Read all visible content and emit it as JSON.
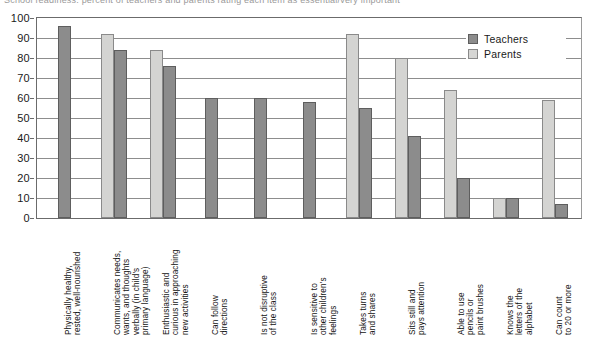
{
  "top_cropped_text": "School readiness: percent of teachers and parents rating each item as essential/very important",
  "legend": {
    "position": "top-right",
    "items": [
      {
        "label": "Teachers",
        "color": "#8c8c8c",
        "key": "teachers"
      },
      {
        "label": "Parents",
        "color": "#d4d4d2",
        "key": "parents"
      }
    ]
  },
  "yaxis": {
    "ticks": [
      "0",
      "10",
      "20",
      "30",
      "40",
      "50",
      "60",
      "70",
      "80",
      "90",
      "100"
    ],
    "min": 0,
    "max": 100
  },
  "chart_data": {
    "type": "bar",
    "title": "",
    "subtitle": "",
    "xlabel": "",
    "ylabel": "",
    "ylim": [
      0,
      100
    ],
    "grid": true,
    "legend_position": "top-right",
    "categories": [
      "Physically healthy, rested, well-nourished",
      "Communicates needs, wants, and thoughts verbally (in child's primary language)",
      "Enthusiastic and curious in approaching new activities",
      "Can follow directions",
      "Is not disruptive of the class",
      "Is sensitive to other children's feelings",
      "Takes turns and shares",
      "Sits still and pays attention",
      "Able to use pencils or paint brushes",
      "Knows the letters of the alphabet",
      "Can count to 20 or more"
    ],
    "category_lines": [
      [
        "Physically healthy,",
        "rested, well-nourished"
      ],
      [
        "Communicates needs,",
        "wants, and thoughts",
        "verbally (in child's",
        "primary language)"
      ],
      [
        "Enthusiastic and",
        "curious in approaching",
        "new activities"
      ],
      [
        "Can follow",
        "directions"
      ],
      [
        "Is not disruptive",
        "of the class"
      ],
      [
        "Is sensitive to",
        "other children's",
        "feelings"
      ],
      [
        "Takes turns",
        "and shares"
      ],
      [
        "Sits still and",
        "pays attention"
      ],
      [
        "Able to use",
        "pencils or",
        "paint brushes"
      ],
      [
        "Knows the",
        "letters of the",
        "alphabet"
      ],
      [
        "Can count",
        "to 20 or more"
      ]
    ],
    "series": [
      {
        "name": "Teachers",
        "color": "#8c8c8c",
        "values": [
          96,
          84,
          76,
          60,
          60,
          58,
          55,
          41,
          20,
          10,
          7
        ]
      },
      {
        "name": "Parents",
        "color": "#d4d4d2",
        "values": [
          null,
          92,
          84,
          null,
          null,
          null,
          92,
          80,
          64,
          10,
          59
        ]
      }
    ],
    "bar_order_per_group": [
      [
        "teachers"
      ],
      [
        "parents",
        "teachers"
      ],
      [
        "parents",
        "teachers"
      ],
      [
        "teachers"
      ],
      [
        "teachers"
      ],
      [
        "teachers"
      ],
      [
        "parents",
        "teachers"
      ],
      [
        "parents",
        "teachers"
      ],
      [
        "parents",
        "teachers"
      ],
      [
        "parents",
        "teachers"
      ],
      [
        "parents",
        "teachers"
      ]
    ]
  }
}
